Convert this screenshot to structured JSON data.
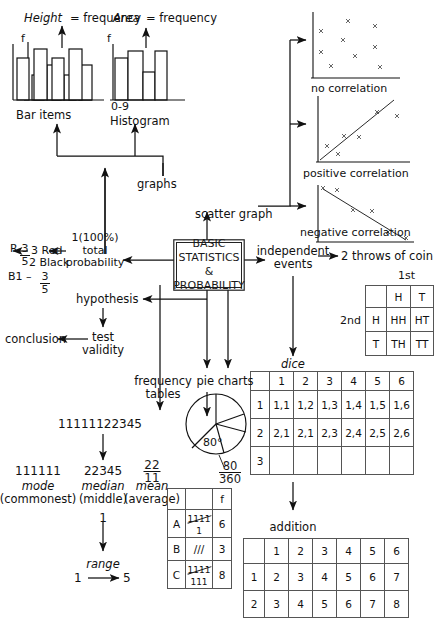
{
  "center": {
    "label": "BASIC\nSTATISTICS &\nPROBABILITY",
    "line1": "BASIC",
    "line2": "STATISTICS &",
    "line3": "PROBABILITY"
  },
  "top_left": {
    "bar_caption_a": "Height",
    "bar_caption_b": "= frequency",
    "bar_axis_label": "f",
    "bar_title": "Bar items",
    "bar_values": [
      3.0,
      4.2,
      5.4,
      4.0,
      5.4
    ],
    "hist_caption_a": "Area",
    "hist_caption_b": "= frequency",
    "hist_axis_label": "f",
    "hist_range_label": "0-9",
    "hist_title": "Histogram"
  },
  "graphs_label": "graphs",
  "scatter_label": "scatter graph",
  "scatters": [
    {
      "caption": "no correlation",
      "points": [
        [
          0.12,
          0.86
        ],
        [
          0.42,
          0.92
        ],
        [
          0.72,
          0.86
        ],
        [
          0.12,
          0.55
        ],
        [
          0.37,
          0.72
        ],
        [
          0.72,
          0.55
        ],
        [
          0.3,
          0.38
        ],
        [
          0.5,
          0.44
        ],
        [
          0.78,
          0.22
        ],
        [
          0.27,
          0.2
        ]
      ]
    },
    {
      "caption": "positive correlation",
      "points": [
        [
          0.1,
          0.18
        ],
        [
          0.22,
          0.32
        ],
        [
          0.3,
          0.22
        ],
        [
          0.4,
          0.42
        ],
        [
          0.55,
          0.5
        ],
        [
          0.72,
          0.8
        ],
        [
          0.88,
          0.72
        ]
      ],
      "trend": [
        [
          0.03,
          0.05
        ],
        [
          0.92,
          0.9
        ]
      ]
    },
    {
      "caption": "negative correlation",
      "points": [
        [
          0.1,
          0.92
        ],
        [
          0.24,
          0.9
        ],
        [
          0.36,
          0.56
        ],
        [
          0.56,
          0.52
        ],
        [
          0.72,
          0.22
        ],
        [
          0.9,
          0.12
        ]
      ],
      "trend": [
        [
          0.07,
          0.95
        ],
        [
          0.94,
          0.08
        ]
      ]
    }
  ],
  "probability": {
    "total_line1": "1(100%)",
    "total_line2": "total",
    "total_line3": "probability",
    "balls_line1": "3 Red",
    "balls_line2": "2 Black",
    "r_label": "R",
    "r_num": "3",
    "r_den": "5",
    "b_label": "B1 –",
    "b_num": "3",
    "b_den": "5"
  },
  "hypothesis": {
    "label": "hypothesis",
    "test_line1": "test",
    "test_line2": "validity",
    "conclusion": "conclusion"
  },
  "independent": {
    "line1": "independent",
    "line2": "events",
    "coin_label_a": "2 throws of ",
    "coin_label_b": "coin",
    "first_label": "1st",
    "second_label": "2nd",
    "coin_table": [
      [
        "",
        "H",
        "T"
      ],
      [
        "H",
        "HH",
        "HT"
      ],
      [
        "T",
        "TH",
        "TT"
      ]
    ],
    "dice_label": "dice",
    "dice_table": [
      [
        "",
        "1",
        "2",
        "3",
        "4",
        "5",
        "6"
      ],
      [
        "1",
        "1,1",
        "1,2",
        "1,3",
        "1,4",
        "1,5",
        "1,6"
      ],
      [
        "2",
        "2,1",
        "2,1",
        "2,3",
        "2,4",
        "2,5",
        "2,6"
      ],
      [
        "3",
        "",
        "",
        "",
        "",
        "",
        ""
      ]
    ],
    "addition_label": "addition",
    "addition_table": [
      [
        "",
        "1",
        "2",
        "3",
        "4",
        "5",
        "6"
      ],
      [
        "1",
        "2",
        "3",
        "4",
        "5",
        "6",
        "7"
      ],
      [
        "2",
        "3",
        "4",
        "5",
        "6",
        "7",
        "8"
      ]
    ]
  },
  "averages": {
    "data_string": "11111122345",
    "mode_value": "111111",
    "mode_name": "mode",
    "mode_sub": "(commonest)",
    "median_value": "22345",
    "median_name": "median",
    "median_sub": "(middle)",
    "mean_num": "22",
    "mean_den": "11",
    "mean_name": "mean",
    "mean_sub": "(average)",
    "mean_result": "1",
    "range_label": "range",
    "range_from": "1",
    "range_to": "5"
  },
  "freq_tables": {
    "line1": "frequency",
    "line2": "tables",
    "header": [
      "",
      "",
      "f"
    ],
    "rows": [
      {
        "category": "A",
        "tally_strike": "1111",
        "tally_rest": "1",
        "freq": "6"
      },
      {
        "category": "B",
        "tally_strike": "",
        "tally_rest": "///",
        "freq": "3"
      },
      {
        "category": "C",
        "tally_strike": "1111",
        "tally_rest": "111",
        "freq": "8"
      }
    ]
  },
  "pie": {
    "label": "pie charts",
    "angle_label": "80°",
    "frac_num": "80",
    "frac_den": "360",
    "slices_deg": [
      0,
      62,
      150,
      230,
      275
    ]
  },
  "colors": {
    "ink": "#111111",
    "line": "#333333",
    "grid": "#555555",
    "bg": "#ffffff"
  }
}
